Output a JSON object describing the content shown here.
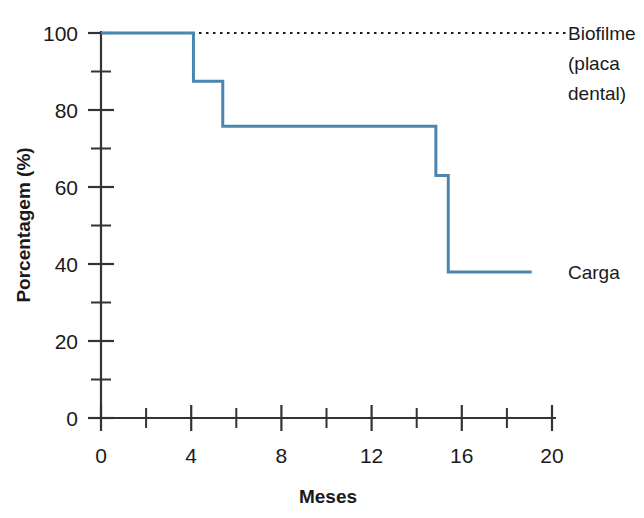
{
  "chart_data": {
    "type": "line",
    "title": "",
    "xlabel": "Meses",
    "ylabel": "Porcentagem (%)",
    "xlim": [
      0,
      20
    ],
    "ylim": [
      0,
      100
    ],
    "grid": false,
    "legend_position": "right-inline",
    "x_ticks_major": [
      0,
      4,
      8,
      12,
      16,
      20
    ],
    "x_tick_labels": [
      "0",
      "4",
      "8",
      "12",
      "16",
      "20"
    ],
    "x_ticks_minor": [
      2,
      6,
      10,
      14,
      18
    ],
    "y_ticks_major": [
      0,
      20,
      40,
      60,
      80,
      100
    ],
    "y_tick_labels": [
      "0",
      "20",
      "40",
      "60",
      "80",
      "100"
    ],
    "y_ticks_minor": [
      10,
      30,
      50,
      70,
      90
    ],
    "colors": {
      "series_carga": "#4a86b0",
      "series_biofilme": "#1a1a1a",
      "axis": "#333333",
      "text": "#1a1a1a",
      "background": "#ffffff"
    },
    "series": [
      {
        "name": "Biofilme (placa dental)",
        "label": "Biofilme\n(placa\ndental)",
        "style": "dotted",
        "color": "#1a1a1a",
        "x": [
          0,
          20.6
        ],
        "values": [
          100,
          100
        ],
        "steps": [
          {
            "x_start": 0,
            "x_end": 20.6,
            "y": 100
          }
        ]
      },
      {
        "name": "Carga",
        "label": "Carga",
        "style": "step",
        "color": "#4a86b0",
        "x": [
          0,
          4.1,
          4.1,
          5.4,
          5.4,
          14.85,
          14.85,
          15.4,
          15.4,
          19.1
        ],
        "values": [
          100,
          100,
          87.5,
          87.5,
          75.8,
          75.8,
          63.0,
          63.0,
          37.9,
          37.9
        ],
        "steps": [
          {
            "x_start": 0,
            "x_end": 4.1,
            "y": 100
          },
          {
            "x_start": 4.1,
            "x_end": 5.4,
            "y": 87.5
          },
          {
            "x_start": 5.4,
            "x_end": 14.85,
            "y": 75.8
          },
          {
            "x_start": 14.85,
            "x_end": 15.4,
            "y": 63.0
          },
          {
            "x_start": 15.4,
            "x_end": 19.1,
            "y": 37.9
          }
        ]
      }
    ],
    "annotations": [
      {
        "name": "biofilme-label",
        "text_lines": [
          "Biofilme",
          "(placa",
          "dental)"
        ],
        "anchor_x": 20.9,
        "anchor_y": 100
      },
      {
        "name": "carga-label",
        "text_lines": [
          "Carga"
        ],
        "anchor_x": 20.9,
        "anchor_y": 37.9
      }
    ]
  },
  "labels": {
    "ylabel": "Porcentagem (%)",
    "xlabel": "Meses",
    "y_tick_0": "0",
    "y_tick_20": "20",
    "y_tick_40": "40",
    "y_tick_60": "60",
    "y_tick_80": "80",
    "y_tick_100": "100",
    "x_tick_0": "0",
    "x_tick_4": "4",
    "x_tick_8": "8",
    "x_tick_12": "12",
    "x_tick_16": "16",
    "x_tick_20": "20",
    "series_biofilme_line1": "Biofilme",
    "series_biofilme_line2": "(placa",
    "series_biofilme_line3": "dental)",
    "series_carga": "Carga"
  }
}
